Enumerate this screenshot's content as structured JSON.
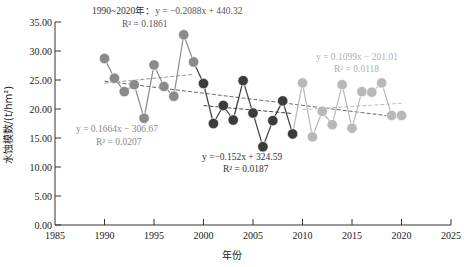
{
  "chart_data": {
    "type": "scatter",
    "title": "",
    "xlabel": "年份",
    "ylabel": "水蚀模数/(t/hm²)",
    "xlim": [
      1985,
      2025
    ],
    "ylim": [
      0,
      35
    ],
    "x_ticks": [
      "1985",
      "1990",
      "1995",
      "2000",
      "2005",
      "2010",
      "2015",
      "2020",
      "2025"
    ],
    "y_ticks": [
      "0.00",
      "5.00",
      "10.00",
      "15.00",
      "20.00",
      "25.00",
      "30.00",
      "35.00"
    ],
    "grid": false,
    "legend": "none",
    "series": [
      {
        "name": "1990–1999",
        "color": "#8a8a8a",
        "x": [
          1990,
          1991,
          1992,
          1993,
          1994,
          1995,
          1996,
          1997,
          1998,
          1999
        ],
        "values": [
          28.7,
          25.3,
          23.0,
          24.2,
          18.4,
          27.6,
          23.9,
          22.2,
          32.8,
          28.1
        ]
      },
      {
        "name": "2000–2009",
        "color": "#3c3c3c",
        "x": [
          2000,
          2001,
          2002,
          2003,
          2004,
          2005,
          2006,
          2007,
          2008,
          2009
        ],
        "values": [
          24.4,
          17.5,
          20.6,
          18.1,
          24.9,
          19.3,
          13.5,
          18.0,
          21.4,
          15.7
        ]
      },
      {
        "name": "2010–2020",
        "color": "#b8b8b8",
        "x": [
          2010,
          2011,
          2012,
          2013,
          2014,
          2015,
          2016,
          2017,
          2018,
          2019,
          2020
        ],
        "values": [
          24.5,
          15.2,
          19.6,
          17.3,
          24.2,
          16.7,
          23.0,
          22.9,
          24.5,
          18.9,
          18.9
        ]
      }
    ],
    "trendlines": [
      {
        "name": "1990-2020",
        "color": "#6a6a6a",
        "slope": -0.2088,
        "intercept": 440.32,
        "x_range": [
          1990,
          2020
        ],
        "label_prefix": "1990~2020年：",
        "equation": "y = −0.2088x + 440.32",
        "r2": "R² = 0.1861"
      },
      {
        "name": "1990-1999",
        "color": "#999999",
        "slope": 0.1664,
        "intercept": -306.67,
        "x_range": [
          1990,
          1999
        ],
        "equation": "y = 0.1664x − 306.67",
        "r2": "R² = 0.0207"
      },
      {
        "name": "2000-2009",
        "color": "#444444",
        "slope": -0.152,
        "intercept": 324.59,
        "x_range": [
          2000,
          2009
        ],
        "equation": "y =−0.152x + 324.59",
        "r2": "R² = 0.0187"
      },
      {
        "name": "2010-2020",
        "color": "#bbbbbb",
        "slope": 0.1099,
        "intercept": -201.01,
        "x_range": [
          2010,
          2020
        ],
        "equation": "y = 0.1099x − 201.01",
        "r2": "R² = 0.0118"
      }
    ],
    "annotations": [
      {
        "text": "1990~2020年：",
        "near": "top-left"
      },
      {
        "text": "y = −0.2088x + 440.32",
        "near": "top-left"
      },
      {
        "text": "R² = 0.1861",
        "near": "top-left"
      },
      {
        "text": "y = 0.1664x − 306.67",
        "near": "middle-left"
      },
      {
        "text": "R² = 0.0207",
        "near": "middle-left"
      },
      {
        "text": "y =−0.152x + 324.59",
        "near": "center"
      },
      {
        "text": "R² = 0.0187",
        "near": "center"
      },
      {
        "text": "y = 0.1099x − 201.01",
        "near": "upper-right"
      },
      {
        "text": "R² = 0.0118",
        "near": "upper-right"
      }
    ]
  }
}
